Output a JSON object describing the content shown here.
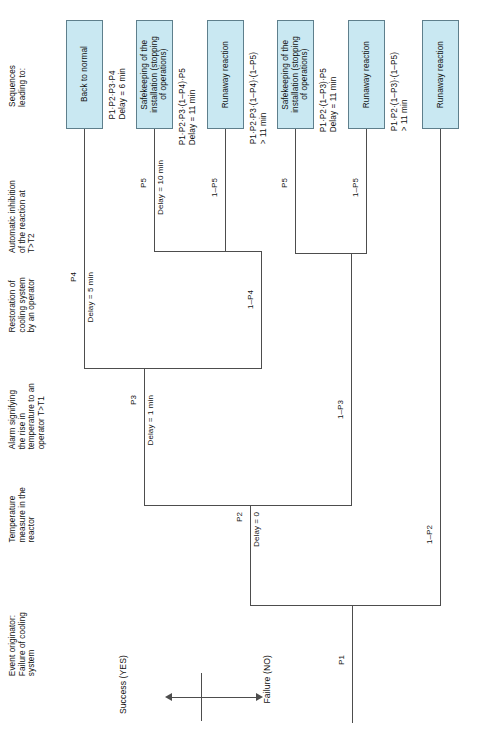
{
  "diagram": {
    "type": "event-tree",
    "box_fill": "#c9e8f2",
    "box_stroke": "#5e7f8c",
    "line_color": "#4d4d4d",
    "orientation": "rotated-90"
  },
  "columns": [
    {
      "id": "initiator",
      "label": "Event originator:\nFailure of cooling\nsystem"
    },
    {
      "id": "temp",
      "label": "Temperature\nmeasure in the\nreactor"
    },
    {
      "id": "alarm",
      "label": "Alarm signifying\nthe rise in\ntemperature to an\noperator T>T1"
    },
    {
      "id": "restoration",
      "label": "Restoration of\ncooling system\nby an operator"
    },
    {
      "id": "inhibition",
      "label": "Automatic inhibition\nof the reaction at\nT>T2"
    },
    {
      "id": "sequences",
      "label": "Sequences\nleading to:"
    }
  ],
  "axis": {
    "success_label": "Success (YES)",
    "failure_label": "Failure (NO)"
  },
  "branches": [
    {
      "id": "p1",
      "prob": "P1",
      "delay": ""
    },
    {
      "id": "p2",
      "prob": "P2",
      "delay": "Delay = 0"
    },
    {
      "id": "n_p2",
      "prob": "1–P2",
      "delay": ""
    },
    {
      "id": "p3",
      "prob": "P3",
      "delay": "Delay = 1 min"
    },
    {
      "id": "n_p3",
      "prob": "1–P3",
      "delay": ""
    },
    {
      "id": "p4",
      "prob": "P4",
      "delay": "Delay = 5 min"
    },
    {
      "id": "n_p4",
      "prob": "1–P4",
      "delay": ""
    },
    {
      "id": "p5_a",
      "prob": "P5",
      "delay": "Delay = 10 min"
    },
    {
      "id": "n_p5_a",
      "prob": "1–P5",
      "delay": ""
    },
    {
      "id": "p5_b",
      "prob": "P5",
      "delay": ""
    },
    {
      "id": "n_p5_b",
      "prob": "1–P5",
      "delay": ""
    }
  ],
  "outcomes": [
    {
      "id": "o1",
      "box": "Back to normal",
      "sequence": "P1·P2·P3·P4\nDelay = 6 min"
    },
    {
      "id": "o2",
      "box": "Safekeeping of the\ninstallation (stopping\nof operations)",
      "sequence": "P1·P2·P3·(1–P4)·P5\nDelay = 11 min"
    },
    {
      "id": "o3",
      "box": "Runaway reaction",
      "sequence": "P1·P2·P3·(1–P4)·(1–P5)\n> 11 min"
    },
    {
      "id": "o4",
      "box": "Safekeeping of the\ninstallation (stopping\nof operations)",
      "sequence": "P1·P2·(1–P3)·P5\nDelay = 11 min"
    },
    {
      "id": "o5",
      "box": "Runaway reaction",
      "sequence": "P1·P2·(1–P3)·(1–P5)\n> 11 min"
    },
    {
      "id": "o6",
      "box": "Runaway reaction",
      "sequence": ""
    }
  ]
}
